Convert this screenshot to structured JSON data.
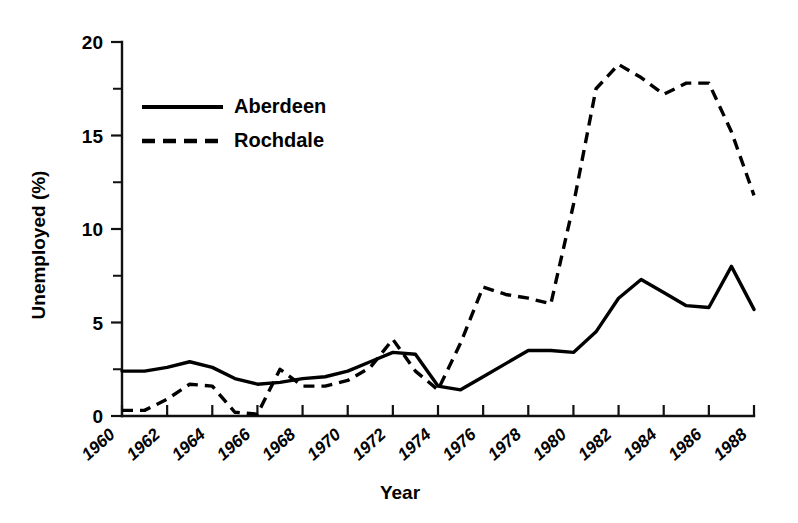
{
  "chart_data": {
    "type": "line",
    "title": "",
    "xlabel": "Year",
    "ylabel": "Unemployed (%)",
    "xlim": [
      1960,
      1988
    ],
    "ylim": [
      0,
      20
    ],
    "grid": false,
    "legend_position": "upper-left-inside",
    "y_ticks_major": [
      0,
      5,
      10,
      15,
      20
    ],
    "y_ticks_minor": [
      2.5,
      7.5,
      12.5,
      17.5
    ],
    "y_tick_labels": [
      "0",
      "5",
      "10",
      "15",
      "20"
    ],
    "x_ticks": [
      1960,
      1962,
      1964,
      1966,
      1968,
      1970,
      1972,
      1974,
      1976,
      1978,
      1980,
      1982,
      1984,
      1986,
      1988
    ],
    "x_tick_labels": [
      "1960",
      "1962",
      "1964",
      "1966",
      "1968",
      "1970",
      "1972",
      "1974",
      "1976",
      "1978",
      "1980",
      "1982",
      "1984",
      "1986",
      "1988"
    ],
    "x": [
      1960,
      1961,
      1962,
      1963,
      1964,
      1965,
      1966,
      1967,
      1968,
      1969,
      1970,
      1971,
      1972,
      1973,
      1974,
      1975,
      1976,
      1977,
      1978,
      1979,
      1980,
      1981,
      1982,
      1983,
      1984,
      1985,
      1986,
      1987,
      1988
    ],
    "series": [
      {
        "name": "Aberdeen",
        "style": "solid",
        "color": "#000000",
        "values": [
          2.4,
          2.4,
          2.6,
          2.9,
          2.6,
          2.0,
          1.7,
          1.8,
          2.0,
          2.1,
          2.4,
          2.9,
          3.4,
          3.3,
          1.6,
          1.4,
          2.1,
          2.8,
          3.5,
          3.5,
          3.4,
          4.5,
          6.3,
          7.3,
          6.6,
          5.9,
          5.8,
          8.0,
          5.7
        ]
      },
      {
        "name": "Rochdale",
        "style": "dashed",
        "color": "#000000",
        "values": [
          0.3,
          0.3,
          0.9,
          1.7,
          1.6,
          0.2,
          0.1,
          2.5,
          1.6,
          1.6,
          1.9,
          2.6,
          4.1,
          2.4,
          1.4,
          3.9,
          6.9,
          6.5,
          6.3,
          6.0,
          11.3,
          17.5,
          18.8,
          18.1,
          17.2,
          17.8,
          17.8,
          15.2,
          11.8
        ]
      }
    ]
  },
  "legend": {
    "entries": [
      {
        "label": "Aberdeen",
        "style": "solid"
      },
      {
        "label": "Rochdale",
        "style": "dashed"
      }
    ]
  }
}
